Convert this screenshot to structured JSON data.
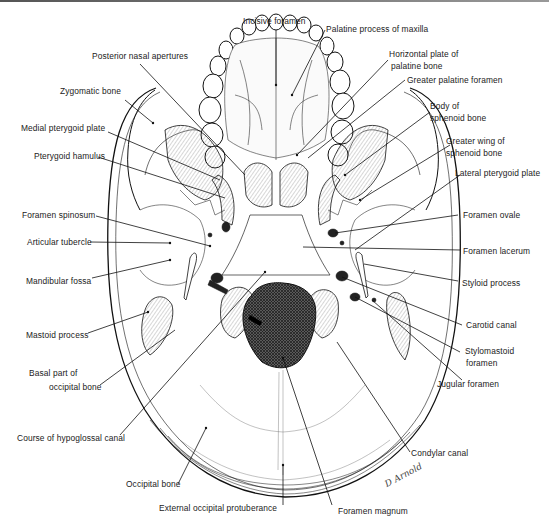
{
  "figure": {
    "signature": "D Arnold",
    "colors": {
      "ink": "#222222",
      "line": "#111111",
      "background": "#ffffff"
    }
  },
  "labels": {
    "incisive_foramen": "Incisive foramen",
    "palatine_process_of_maxilla": "Palatine process of maxilla",
    "posterior_nasal_apertures": "Posterior nasal apertures",
    "horizontal_plate_of_palatine_bone_1": "Horizontal plate of",
    "horizontal_plate_of_palatine_bone_2": "palatine bone",
    "greater_palatine_foramen": "Greater palatine foramen",
    "zygomatic_bone": "Zygomatic bone",
    "body_of_sphenoid_bone_1": "Body of",
    "body_of_sphenoid_bone_2": "sphenoid bone",
    "medial_pterygoid_plate": "Medial pterygoid plate",
    "greater_wing_of_sphenoid_bone_1": "Greater wing of",
    "greater_wing_of_sphenoid_bone_2": "sphenoid bone",
    "pterygoid_hamulus": "Pterygoid hamulus",
    "lateral_pterygoid_plate": "Lateral pterygoid plate",
    "foramen_spinosum": "Foramen spinosum",
    "foramen_ovale": "Foramen ovale",
    "articular_tubercle": "Articular tubercle",
    "foramen_lacerum": "Foramen lacerum",
    "mandibular_fossa": "Mandibular fossa",
    "styloid_process": "Styloid process",
    "mastoid_process": "Mastoid process",
    "carotid_canal": "Carotid canal",
    "stylomastoid_foramen_1": "Stylomastoid",
    "stylomastoid_foramen_2": "foramen",
    "basal_part_of_occipital_bone_1": "Basal part of",
    "basal_part_of_occipital_bone_2": "occipital bone",
    "jugular_foramen": "Jugular foramen",
    "course_of_hypoglossal_canal": "Course of hypoglossal canal",
    "condylar_canal": "Condylar canal",
    "occipital_bone": "Occipital bone",
    "external_occipital_protuberance": "External occipital protuberance",
    "foramen_magnum": "Foramen magnum"
  }
}
